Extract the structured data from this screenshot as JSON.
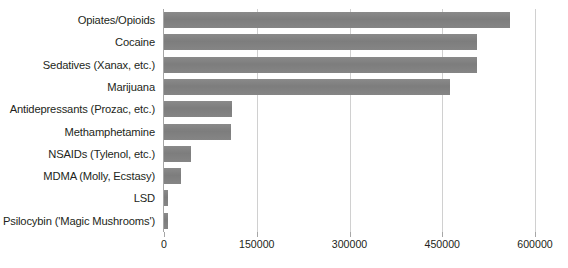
{
  "chart_data": {
    "type": "bar",
    "orientation": "horizontal",
    "title": "",
    "xlabel": "",
    "ylabel": "",
    "xlim": [
      0,
      600000
    ],
    "grid": true,
    "legend": false,
    "bar_color": "#808080",
    "axis_color": "#a6a6a6",
    "gridline_color": "#d0d0d0",
    "text_color": "#231f20",
    "xticks": [
      "0",
      "150000",
      "300000",
      "450000",
      "600000"
    ],
    "xtick_values": [
      0,
      150000,
      300000,
      450000,
      600000
    ],
    "categories": [
      "Opiates/Opioids",
      "Cocaine",
      "Sedatives (Xanax, etc.)",
      "Marijuana",
      "Antidepressants (Prozac, etc.)",
      "Methamphetamine",
      "NSAIDs (Tylenol, etc.)",
      "MDMA (Molly, Ecstasy)",
      "LSD",
      "Psilocybin ('Magic Mushrooms')"
    ],
    "values": [
      560000,
      506000,
      506000,
      463000,
      110000,
      108000,
      44000,
      28000,
      6000,
      6000
    ]
  }
}
